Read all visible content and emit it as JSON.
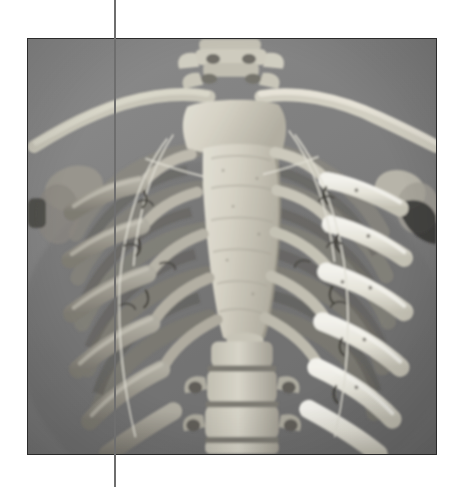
{
  "page": {
    "background_color": "#ffffff",
    "width": 456,
    "height": 487
  },
  "crop_line": {
    "name": "vertical-crop-line",
    "color": "#6e6e6e",
    "x": 114,
    "width": 2,
    "orientation": "vertical",
    "spans_full_height": true
  },
  "photo": {
    "subject": "Anatomical skeleton model of the human thorax (rib cage), anterior view",
    "alt_text": "Grayscale photograph of an articulated human rib cage model showing sternum, clavicles, ribs, costal cartilage and vertebrae, mounted with wire",
    "color_mode": "grayscale",
    "frame": {
      "x": 27,
      "y": 38,
      "width": 410,
      "height": 417,
      "border_color": "#2b2b2b",
      "border_width": 1
    },
    "background_color": "#7c7c7c",
    "tone_range": {
      "darkest": "#3a3a3a",
      "midtone": "#8a8a8a",
      "brightest": "#f2f0ea"
    },
    "anatomy_labels": [
      "cervical vertebrae",
      "clavicle (left)",
      "clavicle (right)",
      "manubrium",
      "sternum body",
      "xiphoid process",
      "true ribs",
      "costal cartilage",
      "thoracic vertebrae",
      "lumbar vertebrae",
      "scapula (left)",
      "scapula (right)",
      "mounting wire"
    ]
  }
}
